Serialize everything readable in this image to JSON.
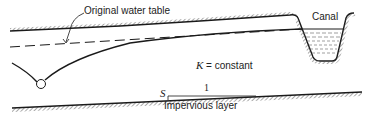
{
  "diagram": {
    "type": "groundwater drawdown cross-section",
    "labels": {
      "original_water_table": "Original water table",
      "canal": "Canal",
      "k_symbol": "K",
      "k_rest": " = constant",
      "slope_symbol": "S",
      "slope_run": "1",
      "impervious_layer": "Impervious layer"
    },
    "elements": [
      "ground-surface",
      "canal",
      "canal-water",
      "original-water-table-dashed",
      "drawdown-curve",
      "well",
      "impervious-layer",
      "slope-triangle"
    ],
    "colors": {
      "line": "#1a1a1a",
      "hatch": "#555555",
      "background": "#ffffff"
    }
  }
}
